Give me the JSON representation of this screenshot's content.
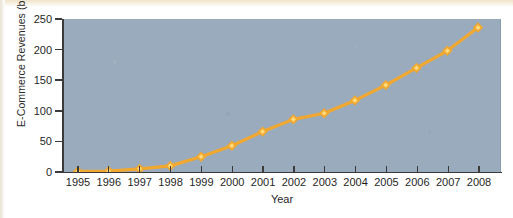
{
  "figure": {
    "background_color": "#ffffff",
    "plot_background_color": "#9aabbd",
    "series_color": "#f0a830",
    "marker_highlight_color": "#ffd97a",
    "axis_color": "#3a3a3a"
  },
  "chart_data": {
    "type": "line",
    "title": "",
    "xlabel": "Year",
    "ylabel": "E-Commerce Revenues (billions)",
    "categories": [
      "1995",
      "1996",
      "1997",
      "1998",
      "1999",
      "2000",
      "2001",
      "2002",
      "2003",
      "2004",
      "2005",
      "2006",
      "2007",
      "2008"
    ],
    "values": [
      1,
      1.5,
      5,
      10,
      25,
      43,
      66,
      86,
      96,
      117,
      142,
      170,
      198,
      236
    ],
    "series": [
      {
        "name": "E-Commerce Revenues",
        "values": [
          1,
          1.5,
          5,
          10,
          25,
          43,
          66,
          86,
          96,
          117,
          142,
          170,
          198,
          236
        ],
        "marker": "diamond",
        "color": "#f0a830"
      }
    ],
    "xlim": [
      1995,
      2008
    ],
    "ylim": [
      0,
      250
    ],
    "ytick_labels": [
      "0",
      "50",
      "100",
      "150",
      "200",
      "250"
    ],
    "ytick_values": [
      0,
      50,
      100,
      150,
      200,
      250
    ],
    "xtick_labels": [
      "1995",
      "1996",
      "1997",
      "1998",
      "1999",
      "2000",
      "2001",
      "2002",
      "2003",
      "2004",
      "2005",
      "2006",
      "2007",
      "2008"
    ],
    "grid": false,
    "legend": false,
    "legend_position": "none"
  }
}
